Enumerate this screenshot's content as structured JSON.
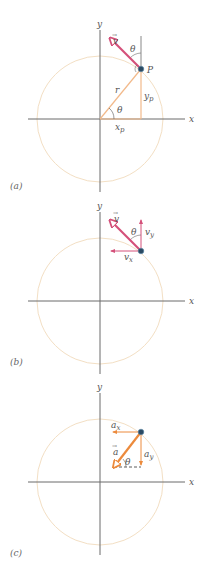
{
  "colors": {
    "axis": "#6b6b6b",
    "circle": "#f3dfc4",
    "velocity": "#d4507a",
    "velocity_fill": "#ffffff",
    "radius": "#f2b98a",
    "acceleration": "#ec8a3c",
    "particle": "#2b4a63",
    "label": "#555555"
  },
  "panels": [
    {
      "id": "a",
      "label": "(a)",
      "axis_x_label": "x",
      "axis_y_label": "y",
      "labels": {
        "velocity": "v",
        "theta_top": "θ",
        "point": "P",
        "radius": "r",
        "theta_center": "θ",
        "y_component": "y",
        "y_sub": "p",
        "x_component": "x",
        "x_sub": "p"
      }
    },
    {
      "id": "b",
      "label": "(b)",
      "axis_x_label": "x",
      "axis_y_label": "y",
      "labels": {
        "velocity": "v",
        "theta": "θ",
        "vy": "v",
        "vy_sub": "y",
        "vx": "v",
        "vx_sub": "x"
      }
    },
    {
      "id": "c",
      "label": "(c)",
      "axis_x_label": "x",
      "axis_y_label": "y",
      "labels": {
        "ax": "a",
        "ax_sub": "x",
        "accel": "a",
        "theta": "θ",
        "ay": "a",
        "ay_sub": "y"
      }
    }
  ]
}
